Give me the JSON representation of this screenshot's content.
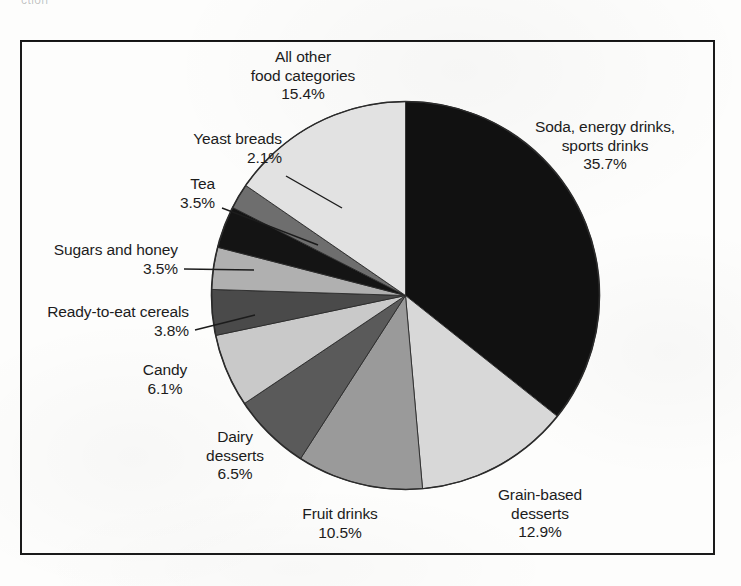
{
  "top_cropped_text": "ction",
  "chart_data": {
    "type": "pie",
    "title": "",
    "legend_position": "callout-labels",
    "grid": false,
    "start_angle_deg": 0,
    "direction": "clockwise",
    "total_percent": 100.0,
    "categories": [
      "Soda, energy drinks, sports drinks",
      "Grain-based desserts",
      "Fruit drinks",
      "Dairy desserts",
      "Candy",
      "Ready-to-eat cereals",
      "Sugars and honey",
      "Tea",
      "Yeast breads",
      "All other food categories"
    ],
    "values": [
      35.7,
      12.9,
      10.5,
      6.5,
      6.1,
      3.8,
      3.5,
      3.5,
      2.1,
      15.4
    ],
    "value_labels": [
      "35.7%",
      "12.9%",
      "10.5%",
      "6.5%",
      "6.1%",
      "3.8%",
      "3.5%",
      "3.5%",
      "2.1%",
      "15.4%"
    ],
    "colors": [
      "#111111",
      "#d8d8d8",
      "#9a9a9a",
      "#5a5a5a",
      "#c9c9c9",
      "#4a4a4a",
      "#b0b0b0",
      "#141414",
      "#6e6e6e",
      "#e2e2e2"
    ]
  },
  "slices": [
    {
      "name": "soda",
      "label_line1": "Soda, energy drinks,",
      "label_line2": "sports drinks",
      "percent": "35.7%",
      "color": "#111111"
    },
    {
      "name": "grain-based-desserts",
      "label_line1": "Grain-based",
      "label_line2": "desserts",
      "percent": "12.9%",
      "color": "#d8d8d8"
    },
    {
      "name": "fruit-drinks",
      "label_line1": "Fruit drinks",
      "label_line2": "",
      "percent": "10.5%",
      "color": "#9a9a9a"
    },
    {
      "name": "dairy-desserts",
      "label_line1": "Dairy",
      "label_line2": "desserts",
      "percent": "6.5%",
      "color": "#5a5a5a"
    },
    {
      "name": "candy",
      "label_line1": "Candy",
      "label_line2": "",
      "percent": "6.1%",
      "color": "#c9c9c9"
    },
    {
      "name": "ready-to-eat-cereals",
      "label_line1": "Ready-to-eat cereals",
      "label_line2": "",
      "percent": "3.8%",
      "color": "#4a4a4a"
    },
    {
      "name": "sugars-and-honey",
      "label_line1": "Sugars and honey",
      "label_line2": "",
      "percent": "3.5%",
      "color": "#b0b0b0"
    },
    {
      "name": "tea",
      "label_line1": "Tea",
      "label_line2": "",
      "percent": "3.5%",
      "color": "#141414"
    },
    {
      "name": "yeast-breads",
      "label_line1": "Yeast breads",
      "label_line2": "",
      "percent": "2.1%",
      "color": "#6e6e6e"
    },
    {
      "name": "all-other-food-categories",
      "label_line1": "All other",
      "label_line2": "food categories",
      "percent": "15.4%",
      "color": "#e2e2e2"
    }
  ]
}
